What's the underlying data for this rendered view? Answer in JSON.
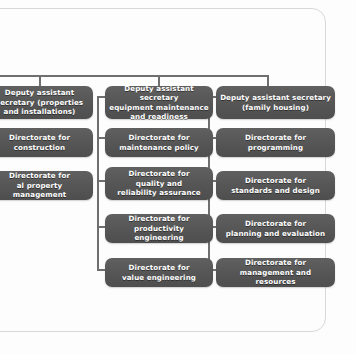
{
  "diagram": {
    "type": "organization-chart",
    "title_visible": false,
    "orientation": "top-down, three columns",
    "colors": {
      "node_fill": "#575757",
      "node_text": "#ffffff",
      "connector": "#6f6f6f",
      "page_background": "#fdfdfd",
      "page_border": "#d8d8d8"
    },
    "columns": [
      {
        "id": "properties-and-installations",
        "clipped_at_left_edge": true,
        "header": {
          "label": "Deputy assistant\nsecretary (properties\nand installations)"
        },
        "children": [
          {
            "label": "Directorate for\nconstruction"
          },
          {
            "label": "Directorate for\nal property management"
          }
        ]
      },
      {
        "id": "equipment-maintenance-and-readiness",
        "clipped_at_left_edge": false,
        "header": {
          "label": "Deputy assistant secretary\nequipment maintenance\nand readiness"
        },
        "children": [
          {
            "label": "Directorate for\nmaintenance policy"
          },
          {
            "label": "Directorate for\nquality and\nreliability assurance"
          },
          {
            "label": "Directorate for\nproductivity engineering"
          },
          {
            "label": "Directorate for\nvalue engineering"
          }
        ]
      },
      {
        "id": "family-housing",
        "clipped_at_left_edge": false,
        "header": {
          "label": "Deputy assistant secretary\n(family housing)"
        },
        "children": [
          {
            "label": "Directorate for\nprogramming"
          },
          {
            "label": "Directorate for\nstandards and design"
          },
          {
            "label": "Directorate for\nplanning and evaluation"
          },
          {
            "label": "Directorate for\nmanagement and resources"
          }
        ]
      }
    ]
  }
}
